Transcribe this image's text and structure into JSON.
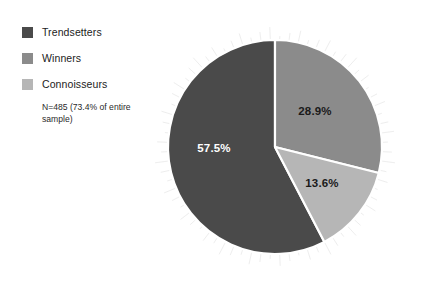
{
  "chart_data": {
    "type": "pie",
    "title": "",
    "subtitle": "",
    "xlabel": "",
    "ylabel": "",
    "legend_position": "top-left",
    "grid": false,
    "annotation": "N=485 (73.4% of entire sample)",
    "categories": [
      "Trendsetters",
      "Winners",
      "Connoisseurs"
    ],
    "values": [
      57.5,
      28.9,
      13.6
    ],
    "value_labels": [
      "57.5%",
      "28.9%",
      "13.6%"
    ],
    "colors": [
      "#4a4a4a",
      "#8b8b8b",
      "#b6b6b6"
    ],
    "slices": [
      {
        "name": "Trendsetters",
        "value": 57.5,
        "label": "57.5%",
        "color": "#4a4a4a",
        "label_color": "#ffffff",
        "start_angle": 152.5,
        "end_angle": 360.0
      },
      {
        "name": "Winners",
        "value": 28.9,
        "label": "28.9%",
        "color": "#8b8b8b",
        "label_color": "#1a1a1a",
        "start_angle": 0.0,
        "end_angle": 104.04
      },
      {
        "name": "Connoisseurs",
        "value": 13.6,
        "label": "13.6%",
        "color": "#b6b6b6",
        "label_color": "#1a1a1a",
        "start_angle": 104.04,
        "end_angle": 152.5
      }
    ]
  },
  "legend": {
    "items": [
      {
        "label": "Trendsetters",
        "color": "#4a4a4a"
      },
      {
        "label": "Winners",
        "color": "#8b8b8b"
      },
      {
        "label": "Connoisseurs",
        "color": "#b6b6b6"
      }
    ],
    "note": "N=485 (73.4% of entire sample)"
  },
  "pie": {
    "center_x": 125,
    "center_y": 127,
    "radius": 107,
    "separator_color": "#ffffff",
    "separator_width": 2.2,
    "label_positions": [
      {
        "label": "57.5%",
        "x": 64,
        "y": 132,
        "color": "#ffffff"
      },
      {
        "label": "28.9%",
        "x": 165,
        "y": 95,
        "color": "#1a1a1a"
      },
      {
        "label": "13.6%",
        "x": 172,
        "y": 167,
        "color": "#1a1a1a"
      }
    ]
  },
  "background": "#ffffff"
}
